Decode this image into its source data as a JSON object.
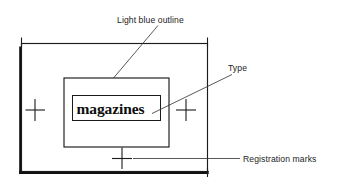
{
  "diagram": {
    "background_color": "#ffffff",
    "ink_color": "#1b1b1b",
    "artwork": {
      "specimen_text": "magazines"
    },
    "annotations": [
      {
        "id": "light-blue-outline",
        "label": "Light blue outline",
        "points_to": "middle-rectangle"
      },
      {
        "id": "type",
        "label": "Type",
        "points_to": "type-box"
      },
      {
        "id": "registration-marks",
        "label": "Registration marks",
        "points_to": "bottom-registration-mark"
      }
    ],
    "registration_marks": [
      {
        "id": "left-registration-mark",
        "position": "left"
      },
      {
        "id": "right-registration-mark",
        "position": "right"
      },
      {
        "id": "bottom-registration-mark",
        "position": "bottom"
      }
    ]
  }
}
